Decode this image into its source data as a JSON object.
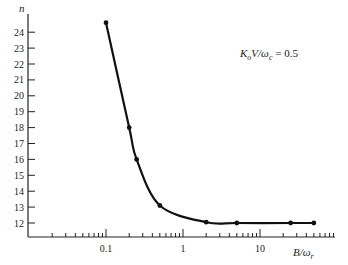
{
  "chart_data": {
    "type": "line",
    "title": "",
    "annotation": "K_o V/ω_c = 0.5",
    "xlabel": "B/ω_r",
    "ylabel": "n",
    "xscale": "log",
    "xlim": [
      0.01,
      100
    ],
    "ylim": [
      11,
      25
    ],
    "x_tick_labels": [
      "0.1",
      "1",
      "10"
    ],
    "y_tick_labels": [
      "12",
      "13",
      "14",
      "15",
      "16",
      "17",
      "18",
      "19",
      "20",
      "21",
      "22",
      "23",
      "24"
    ],
    "grid": false,
    "legend": null,
    "series": [
      {
        "name": "K_o V/ω_c = 0.5",
        "x": [
          0.1,
          0.2,
          0.25,
          0.5,
          2,
          5,
          25,
          50
        ],
        "y": [
          24.6,
          18,
          16,
          13.1,
          12.05,
          12,
          12,
          12
        ]
      }
    ]
  },
  "labels": {
    "y_axis": "n",
    "x_axis_main": "B/ω",
    "x_axis_sub": "r",
    "annot_K": "K",
    "annot_o": "o",
    "annot_V": "V/ω",
    "annot_c": "c",
    "annot_val": " = 0.5"
  }
}
